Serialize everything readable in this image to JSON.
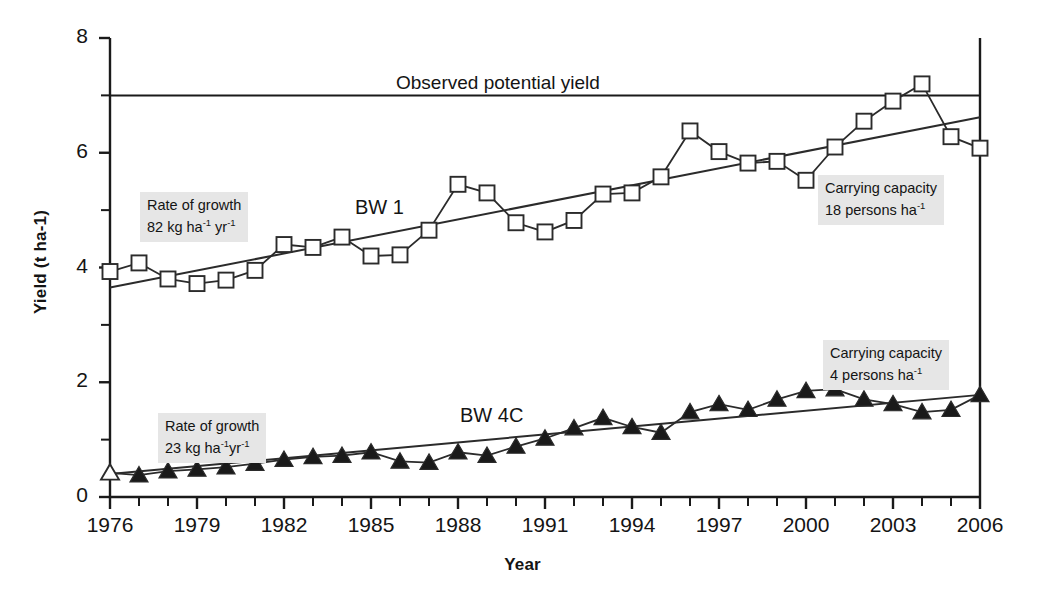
{
  "chart_data": {
    "type": "line",
    "title": "",
    "xlabel": "Year",
    "ylabel": "Yield (t ha-1)",
    "xlim": [
      1976,
      2006
    ],
    "ylim": [
      0,
      8
    ],
    "y_ticks_major": [
      0,
      2,
      4,
      6,
      8
    ],
    "y_ticks_minor": [
      1,
      3,
      5,
      7
    ],
    "y_tick_labels": [
      "0",
      "2",
      "4",
      "6",
      "8"
    ],
    "x_tick_labels": [
      "1976",
      "1979",
      "1982",
      "1985",
      "1988",
      "1991",
      "1994",
      "1997",
      "2000",
      "2003",
      "2006"
    ],
    "x_tick_values": [
      1976,
      1979,
      1982,
      1985,
      1988,
      1991,
      1994,
      1997,
      2000,
      2003,
      2006
    ],
    "x_minor_step": 1,
    "grid": false,
    "legend": "none",
    "x": [
      1976,
      1977,
      1978,
      1979,
      1980,
      1981,
      1982,
      1983,
      1984,
      1985,
      1986,
      1987,
      1988,
      1989,
      1990,
      1991,
      1992,
      1993,
      1994,
      1995,
      1996,
      1997,
      1998,
      1999,
      2000,
      2001,
      2002,
      2003,
      2004,
      2005,
      2006
    ],
    "series": [
      {
        "name": "BW 1",
        "marker": "open-square",
        "values": [
          3.93,
          4.08,
          3.8,
          3.72,
          3.78,
          3.95,
          4.4,
          4.35,
          4.53,
          4.2,
          4.22,
          4.65,
          5.45,
          5.3,
          4.78,
          4.62,
          4.82,
          5.28,
          5.3,
          5.58,
          6.38,
          6.02,
          5.82,
          5.85,
          5.52,
          6.1,
          6.55,
          6.9,
          7.2,
          6.28,
          6.08
        ],
        "trend": {
          "y_start": 3.65,
          "y_end": 6.62,
          "rate_label": "82 kg ha-1 yr-1"
        }
      },
      {
        "name": "BW 4C",
        "marker": "filled-triangle",
        "first_marker": "open-triangle",
        "values": [
          0.42,
          0.38,
          0.45,
          0.48,
          0.52,
          0.58,
          0.65,
          0.7,
          0.72,
          0.78,
          0.62,
          0.6,
          0.78,
          0.72,
          0.88,
          1.02,
          1.2,
          1.38,
          1.22,
          1.12,
          1.48,
          1.62,
          1.52,
          1.7,
          1.85,
          1.88,
          1.7,
          1.62,
          1.48,
          1.52,
          1.78
        ],
        "trend": {
          "y_start": 0.4,
          "y_end": 1.78,
          "rate_label": "23 kg ha-1 yr-1"
        }
      }
    ],
    "reference_lines": [
      {
        "name": "observed-potential-yield",
        "y": 7.0,
        "label": "Observed potential yield"
      }
    ],
    "annotations": [
      {
        "id": "rate-bw1",
        "line1": "Rate of growth",
        "line2_pre": "82 kg ha",
        "line2_sup1": "-1",
        "line2_mid": " yr",
        "line2_sup2": "-1",
        "x": 140,
        "y": 192
      },
      {
        "id": "rate-bw4c",
        "line1": "Rate of growth",
        "line2_pre": "23 kg ha",
        "line2_sup1": "-1",
        "line2_mid": "yr",
        "line2_sup2": "-1",
        "x": 158,
        "y": 413
      },
      {
        "id": "carrying-capacity-bw1",
        "line1": "Carrying capacity",
        "line2_pre": "18 persons ha",
        "line2_sup1": "-1",
        "line2_mid": "",
        "line2_sup2": "",
        "x": 818,
        "y": 175
      },
      {
        "id": "carrying-capacity-bw4c",
        "line1": "Carrying capacity",
        "line2_pre": "4 persons ha",
        "line2_sup1": "-1",
        "line2_mid": "",
        "line2_sup2": "",
        "x": 823,
        "y": 340
      }
    ],
    "series_labels": [
      {
        "id": "bw1-label",
        "text": "BW 1",
        "x": 355,
        "y": 196
      },
      {
        "id": "bw4c-label",
        "text": "BW 4C",
        "x": 460,
        "y": 404
      }
    ],
    "potential_yield_label": {
      "text": "Observed potential yield",
      "x": 396,
      "y": 72
    },
    "colors": {
      "axis": "#1a1a1a",
      "line": "#2b2b2b",
      "marker_open_fill": "#ffffff",
      "marker_filled": "#1a1a1a",
      "annotation_bg": "#e6e6e6",
      "background": "#ffffff"
    }
  },
  "axes": {
    "x_title": "Year",
    "y_title": "Yield (t ha-1)"
  }
}
